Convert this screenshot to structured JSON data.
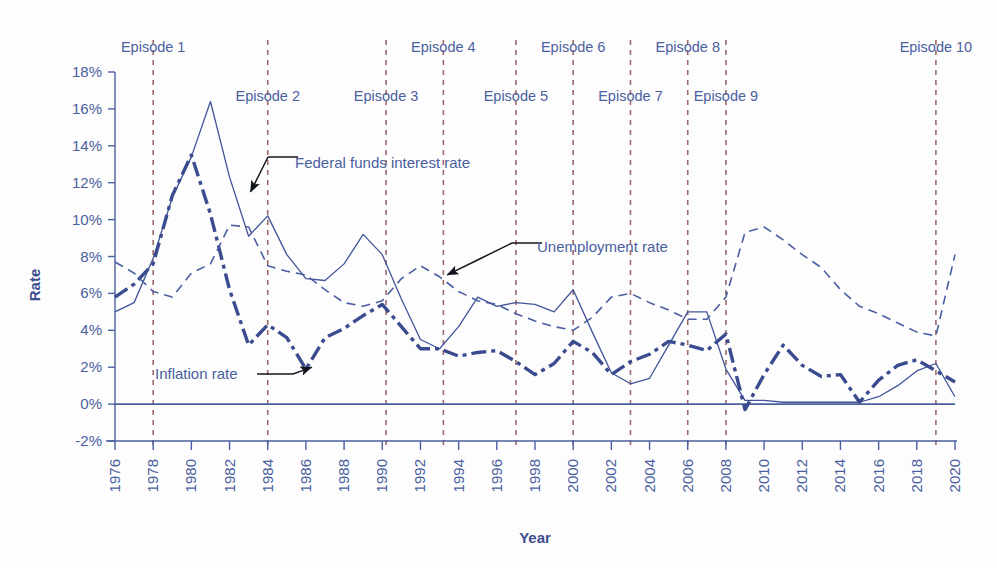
{
  "chart_data": {
    "type": "line",
    "title": "",
    "xlabel": "Year",
    "ylabel": "Rate",
    "xlim": [
      1976,
      2020
    ],
    "ylim": [
      -2,
      18
    ],
    "grid": false,
    "legend_position": "inline-annotations",
    "y_ticks": [
      "18%",
      "16%",
      "14%",
      "12%",
      "10%",
      "8%",
      "6%",
      "4%",
      "2%",
      "0%",
      "-2%"
    ],
    "y_tick_values": [
      18,
      16,
      14,
      12,
      10,
      8,
      6,
      4,
      2,
      0,
      -2
    ],
    "x_ticks": [
      "1976",
      "1978",
      "1980",
      "1982",
      "1984",
      "1986",
      "1988",
      "1990",
      "1992",
      "1994",
      "1996",
      "1998",
      "2000",
      "2002",
      "2004",
      "2006",
      "2008",
      "2010",
      "2012",
      "2014",
      "2016",
      "2018",
      "2020"
    ],
    "x_tick_values": [
      1976,
      1978,
      1980,
      1982,
      1984,
      1986,
      1988,
      1990,
      1992,
      1994,
      1996,
      1998,
      2000,
      2002,
      2004,
      2006,
      2008,
      2010,
      2012,
      2014,
      2016,
      2018,
      2020
    ],
    "x": [
      1976,
      1977,
      1978,
      1979,
      1980,
      1981,
      1982,
      1983,
      1984,
      1985,
      1986,
      1987,
      1988,
      1989,
      1990,
      1991,
      1992,
      1993,
      1994,
      1995,
      1996,
      1997,
      1998,
      1999,
      2000,
      2001,
      2002,
      2003,
      2004,
      2005,
      2006,
      2007,
      2008,
      2009,
      2010,
      2011,
      2012,
      2013,
      2014,
      2015,
      2016,
      2017,
      2018,
      2019,
      2020
    ],
    "series": [
      {
        "name": "Federal funds interest rate",
        "style": "solid-thin",
        "color": "#41549a",
        "values": [
          5.0,
          5.5,
          7.9,
          11.2,
          13.4,
          16.4,
          12.3,
          9.1,
          10.2,
          8.1,
          6.8,
          6.7,
          7.6,
          9.2,
          8.1,
          5.7,
          3.5,
          3.0,
          4.2,
          5.8,
          5.3,
          5.5,
          5.4,
          5.0,
          6.2,
          3.9,
          1.7,
          1.1,
          1.4,
          3.2,
          5.0,
          5.0,
          1.9,
          0.2,
          0.2,
          0.1,
          0.1,
          0.1,
          0.1,
          0.1,
          0.4,
          1.0,
          1.8,
          2.2,
          0.4
        ]
      },
      {
        "name": "Inflation rate",
        "style": "dash-dot-thick",
        "color": "#3a4b8f",
        "values": [
          5.8,
          6.5,
          7.6,
          11.3,
          13.5,
          10.3,
          6.2,
          3.2,
          4.3,
          3.6,
          1.9,
          3.6,
          4.1,
          4.8,
          5.4,
          4.2,
          3.0,
          3.0,
          2.6,
          2.8,
          2.9,
          2.3,
          1.6,
          2.2,
          3.4,
          2.8,
          1.6,
          2.3,
          2.7,
          3.4,
          3.2,
          2.9,
          3.8,
          -0.3,
          1.6,
          3.2,
          2.1,
          1.5,
          1.6,
          0.1,
          1.3,
          2.1,
          2.4,
          1.8,
          1.2
        ]
      },
      {
        "name": "Unemployment rate",
        "style": "dashed-thin",
        "color": "#4c5ea3",
        "values": [
          7.7,
          7.1,
          6.1,
          5.8,
          7.1,
          7.6,
          9.7,
          9.6,
          7.5,
          7.2,
          7.0,
          6.2,
          5.5,
          5.3,
          5.6,
          6.8,
          7.5,
          6.9,
          6.1,
          5.6,
          5.4,
          4.9,
          4.5,
          4.2,
          4.0,
          4.7,
          5.8,
          6.0,
          5.5,
          5.1,
          4.6,
          4.6,
          5.8,
          9.3,
          9.6,
          8.9,
          8.1,
          7.4,
          6.2,
          5.3,
          4.9,
          4.4,
          3.9,
          3.7,
          8.1
        ]
      }
    ],
    "vertical_markers": [
      {
        "label": "Episode 1",
        "year": 1978,
        "row": 0
      },
      {
        "label": "Episode 2",
        "year": 1984,
        "row": 1
      },
      {
        "label": "Episode 3",
        "year": 1990.2,
        "row": 1
      },
      {
        "label": "Episode 4",
        "year": 1993.2,
        "row": 0
      },
      {
        "label": "Episode 5",
        "year": 1997,
        "row": 1
      },
      {
        "label": "Episode 6",
        "year": 2000,
        "row": 0
      },
      {
        "label": "Episode 7",
        "year": 2003,
        "row": 1
      },
      {
        "label": "Episode 8",
        "year": 2006,
        "row": 0
      },
      {
        "label": "Episode 9",
        "year": 2008,
        "row": 1
      },
      {
        "label": "Episode 10",
        "year": 2019,
        "row": 0
      }
    ],
    "annotations": [
      {
        "text": "Federal funds interest rate",
        "target_year": 1983.1,
        "target_value": 11.5
      },
      {
        "text": "Unemployment rate",
        "target_year": 1993.4,
        "target_value": 7.0
      },
      {
        "text": "Inflation rate",
        "target_year": 1986.3,
        "target_value": 2.0
      }
    ],
    "colors": {
      "line": "#3a4b8f",
      "marker_line": "#9c6a6a",
      "text": "#4a5fa0",
      "zero_line": "#4a5fa0",
      "background": "#ffffff"
    }
  }
}
